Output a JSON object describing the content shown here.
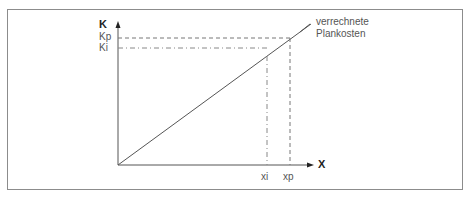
{
  "diagram": {
    "y_axis_label": "K",
    "x_axis_label": "X",
    "y_ticks": [
      {
        "label": "Kp",
        "style": "dashed"
      },
      {
        "label": "Ki",
        "style": "dash-dot"
      }
    ],
    "x_ticks": [
      {
        "label": "xi",
        "style": "dash-dot"
      },
      {
        "label": "xp",
        "style": "dashed"
      }
    ],
    "line_label_line1": "verrechnete",
    "line_label_line2": "Plankosten",
    "colors": {
      "frame": "#8c8c8c",
      "axis": "#555555",
      "line": "#555555",
      "text": "#555555"
    }
  }
}
